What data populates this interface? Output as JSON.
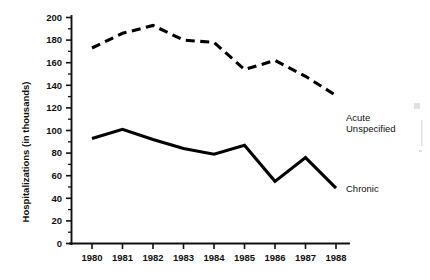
{
  "chart_data": {
    "type": "line",
    "title": "",
    "xlabel": "",
    "ylabel": "Hospitalizations (in thousands)",
    "categories": [
      "1980",
      "1981",
      "1982",
      "1983",
      "1984",
      "1985",
      "1986",
      "1987",
      "1988"
    ],
    "x": [
      1980,
      1981,
      1982,
      1983,
      1984,
      1985,
      1986,
      1987,
      1988
    ],
    "xlim": [
      1980,
      1988
    ],
    "ylim": [
      0,
      200
    ],
    "y_ticks": [
      0,
      20,
      40,
      60,
      80,
      100,
      120,
      140,
      160,
      180,
      200
    ],
    "y_tick_labels": [
      "0",
      "20",
      "40",
      "60",
      "80",
      "100",
      "120",
      "140",
      "160",
      "180",
      "200"
    ],
    "y_minor_tick_step": 10,
    "grid": false,
    "legend_position": "inline-right-end",
    "series": [
      {
        "name": "Acute Unspecified",
        "label_lines": [
          "Acute",
          "Unspecified"
        ],
        "style": "dashed",
        "color": "#000000",
        "values": [
          173,
          186,
          193,
          180,
          178,
          154,
          162,
          148,
          131
        ]
      },
      {
        "name": "Chronic",
        "label_lines": [
          "Chronic"
        ],
        "style": "solid",
        "color": "#000000",
        "values": [
          93,
          101,
          92,
          84,
          79,
          87,
          55,
          76,
          49
        ]
      }
    ]
  },
  "axes": {
    "y_axis_title": "Hospitalizations (in thousands)",
    "y_max_label": "200",
    "y_min_label": "0",
    "x_first_label": "1980",
    "x_last_label": "1988"
  },
  "labels": {
    "acute_line1": "Acute",
    "acute_line2": "Unspecified",
    "chronic": "Chronic"
  },
  "colors": {
    "ink": "#000000",
    "background": "#ffffff",
    "axis": "#111111"
  }
}
